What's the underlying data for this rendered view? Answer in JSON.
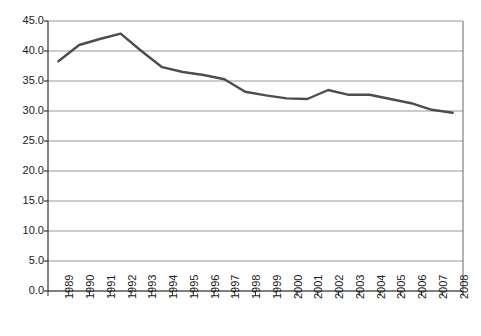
{
  "chart_data": {
    "type": "line",
    "title": "",
    "subtitle": "",
    "xlabel": "",
    "ylabel": "",
    "categories": [
      "1989",
      "1990",
      "1991",
      "1992",
      "1993",
      "1994",
      "1995",
      "1996",
      "1997",
      "1998",
      "1999",
      "2000",
      "2001",
      "2002",
      "2003",
      "2004",
      "2005",
      "2006",
      "2007",
      "2008"
    ],
    "values": [
      38.3,
      41.0,
      42.0,
      42.9,
      40.0,
      37.3,
      36.5,
      36.0,
      35.3,
      33.2,
      32.6,
      32.1,
      32.0,
      33.5,
      32.7,
      32.7,
      32.0,
      31.3,
      30.2,
      29.7
    ],
    "series": [
      {
        "name": "series-1",
        "values": [
          38.3,
          41.0,
          42.0,
          42.9,
          40.0,
          37.3,
          36.5,
          36.0,
          35.3,
          33.2,
          32.6,
          32.1,
          32.0,
          33.5,
          32.7,
          32.7,
          32.0,
          31.3,
          30.2,
          29.7
        ]
      }
    ],
    "ylim": [
      0.0,
      45.0
    ],
    "ytick_values": [
      0.0,
      5.0,
      10.0,
      15.0,
      20.0,
      25.0,
      30.0,
      35.0,
      40.0,
      45.0
    ],
    "ytick_labels": [
      "0.0",
      "5.0",
      "10.0",
      "15.0",
      "20.0",
      "25.0",
      "30.0",
      "35.0",
      "40.0",
      "45.0"
    ],
    "grid": true,
    "grid_axis": "y",
    "legend": false,
    "legend_position": "none",
    "annotations": [],
    "colors": {
      "line": "#4d4d4d",
      "grid": "#999999",
      "axis": "#333333",
      "text": "#1a1a1a",
      "background": "#ffffff"
    },
    "line_width": 2.4,
    "markers": false,
    "xtick_rotation": -90
  }
}
